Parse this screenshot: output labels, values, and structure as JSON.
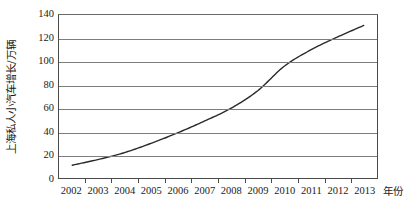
{
  "chart_data": {
    "type": "line",
    "title": "",
    "xlabel": "年份",
    "ylabel": "上海私人小汽车增长/万辆",
    "categories": [
      "2002",
      "2003",
      "2004",
      "2005",
      "2006",
      "2007",
      "2008",
      "2009",
      "2010",
      "2011",
      "2012",
      "2013"
    ],
    "values": [
      11,
      16,
      22,
      30,
      39,
      49,
      60,
      75,
      96,
      110,
      121,
      131
    ],
    "series": [
      {
        "name": "上海私人小汽车增长",
        "values": [
          11,
          16,
          22,
          30,
          39,
          49,
          60,
          75,
          96,
          110,
          121,
          131
        ]
      }
    ],
    "ylim": [
      0,
      140
    ],
    "yticks": [
      0,
      20,
      40,
      60,
      80,
      100,
      120,
      140
    ],
    "ytick_labels": [
      "0",
      "20",
      "40",
      "60",
      "80",
      "100",
      "120",
      "140"
    ],
    "xtick_labels": [
      "2002",
      "2003",
      "2004",
      "2005",
      "2006",
      "2007",
      "2008",
      "2009",
      "2010",
      "2011",
      "2012",
      "2013"
    ],
    "grid": true,
    "grid_axis": "y",
    "legend": false,
    "legend_position": "none",
    "line_color": "#2b2b2b",
    "line_width": 1.4,
    "markers": false,
    "background_color": "#ffffff",
    "axis_color": "#4a4a4a",
    "grid_color": "#7d7d7d"
  }
}
